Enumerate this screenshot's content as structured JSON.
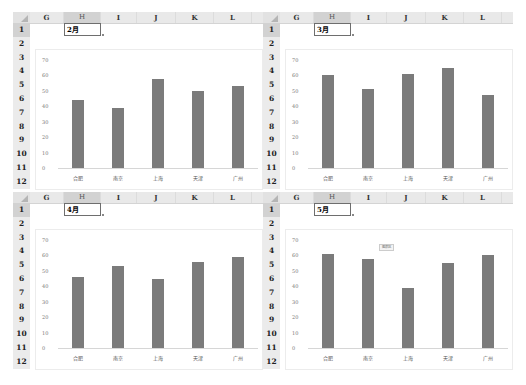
{
  "sheet": {
    "columns": [
      "G",
      "H",
      "I",
      "J",
      "K",
      "L"
    ],
    "selected_column": "H",
    "rows": [
      "1",
      "2",
      "3",
      "4",
      "5",
      "6",
      "7",
      "8",
      "9",
      "10",
      "11",
      "12"
    ],
    "selected_row": "1"
  },
  "panels": [
    {
      "cell_value": "2月"
    },
    {
      "cell_value": "3月"
    },
    {
      "cell_value": "4月"
    },
    {
      "cell_value": "5月",
      "tooltip": "图表区"
    }
  ],
  "colors": {
    "bar": "#7b7b7b",
    "header_bg": "#e9e9e9",
    "selected_header_bg": "#d2d2d2"
  },
  "chart_data": [
    {
      "type": "bar",
      "title": "2月",
      "categories": [
        "合肥",
        "南京",
        "上海",
        "天津",
        "广州"
      ],
      "values": [
        44,
        39,
        58,
        50,
        53
      ],
      "yticks": [
        "70",
        "60",
        "50",
        "40",
        "30",
        "20",
        "10",
        "0"
      ],
      "ylim": [
        0,
        70
      ],
      "xlabel": "",
      "ylabel": "",
      "grid": false,
      "legend": "none"
    },
    {
      "type": "bar",
      "title": "3月",
      "categories": [
        "合肥",
        "南京",
        "上海",
        "天津",
        "广州"
      ],
      "values": [
        60,
        51,
        61,
        65,
        47
      ],
      "yticks": [
        "70",
        "60",
        "50",
        "40",
        "30",
        "20",
        "10",
        "0"
      ],
      "ylim": [
        0,
        70
      ],
      "xlabel": "",
      "ylabel": "",
      "grid": false,
      "legend": "none"
    },
    {
      "type": "bar",
      "title": "4月",
      "categories": [
        "合肥",
        "南京",
        "上海",
        "天津",
        "广州"
      ],
      "values": [
        46,
        53,
        45,
        56,
        59
      ],
      "yticks": [
        "70",
        "60",
        "50",
        "40",
        "30",
        "20",
        "10",
        "0"
      ],
      "ylim": [
        0,
        70
      ],
      "xlabel": "",
      "ylabel": "",
      "grid": false,
      "legend": "none"
    },
    {
      "type": "bar",
      "title": "5月",
      "categories": [
        "合肥",
        "南京",
        "上海",
        "天津",
        "广州"
      ],
      "values": [
        61,
        58,
        39,
        55,
        60
      ],
      "yticks": [
        "70",
        "60",
        "50",
        "40",
        "30",
        "20",
        "10",
        "0"
      ],
      "ylim": [
        0,
        70
      ],
      "xlabel": "",
      "ylabel": "",
      "grid": false,
      "legend": "none"
    }
  ]
}
